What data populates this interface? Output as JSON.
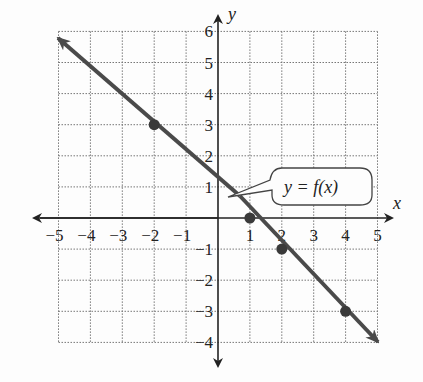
{
  "chart_data": {
    "type": "line",
    "title": "",
    "xlabel": "x",
    "ylabel": "y",
    "xlim": [
      -5,
      5
    ],
    "ylim": [
      -4,
      6
    ],
    "grid": true,
    "x_ticks": [
      "−5",
      "−4",
      "−3",
      "−2",
      "−1",
      "1",
      "2",
      "3",
      "4",
      "5"
    ],
    "y_ticks": [
      "6",
      "5",
      "4",
      "3",
      "2",
      "1",
      "−1",
      "−2",
      "−3",
      "−4"
    ],
    "series": [
      {
        "name": "y = f(x)",
        "x": [
          -5,
          5
        ],
        "y": [
          6,
          -4
        ],
        "arrows": "both"
      }
    ],
    "points": [
      {
        "x": -2,
        "y": 3
      },
      {
        "x": 1,
        "y": 0
      },
      {
        "x": 2,
        "y": -1
      },
      {
        "x": 4,
        "y": -3
      }
    ],
    "annotation": "y = f(x)",
    "line_color": "#4a4a4a"
  },
  "labels": {
    "x_axis": "x",
    "y_axis": "y",
    "function": "y = f(x)",
    "xt": [
      "−5",
      "−4",
      "−3",
      "−2",
      "−1",
      "1",
      "2",
      "3",
      "4",
      "5"
    ],
    "yt": [
      "6",
      "5",
      "4",
      "3",
      "2",
      "1",
      "−1",
      "−2",
      "−3",
      "−4"
    ]
  }
}
